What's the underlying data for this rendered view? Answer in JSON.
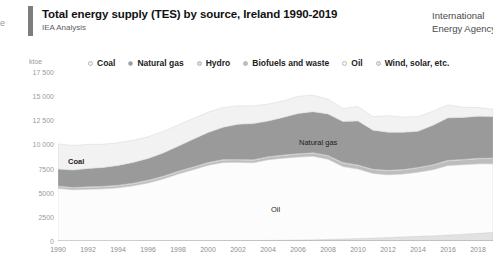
{
  "edge_fragment": "e",
  "header": {
    "title": "Total energy supply (TES) by source, Ireland 1990-2019",
    "subtitle": "IEA Analysis",
    "brand_line1": "International",
    "brand_line2": "Energy Agency"
  },
  "legend": {
    "items": [
      {
        "label": "Coal",
        "color": "#f2f2f2"
      },
      {
        "label": "Natural gas",
        "color": "#9a9a9a"
      },
      {
        "label": "Hydro",
        "color": "#d8d8d8"
      },
      {
        "label": "Biofuels and waste",
        "color": "#bdbdbd"
      },
      {
        "label": "Oil",
        "color": "#fcfcfc"
      },
      {
        "label": "Wind, solar, etc.",
        "color": "#e2e2e2"
      }
    ]
  },
  "axes": {
    "y_unit": "ktoe",
    "y_ticks": [
      "0",
      "2500",
      "5000",
      "7500",
      "10 000",
      "12 500",
      "15 000",
      "17 500"
    ],
    "x_ticks": [
      "1990",
      "1992",
      "1994",
      "1996",
      "1998",
      "2000",
      "2002",
      "2004",
      "2006",
      "2008",
      "2010",
      "2012",
      "2014",
      "2016",
      "2018"
    ]
  },
  "plot_labels": [
    {
      "text": "Coal",
      "x": 10,
      "y": 85,
      "bold": true
    },
    {
      "text": "Oil",
      "x": 213,
      "y": 133,
      "bold": false
    },
    {
      "text": "Natural gas",
      "x": 241,
      "y": 66,
      "bold": false
    }
  ],
  "chart_data": {
    "type": "area",
    "title": "Total energy supply (TES) by source, Ireland 1990-2019",
    "subtitle": "IEA Analysis",
    "xlabel": "",
    "ylabel": "ktoe",
    "ylim": [
      0,
      17500
    ],
    "xlim": [
      1990,
      2019
    ],
    "grid": false,
    "legend_position": "top",
    "stacked": true,
    "x": [
      1990,
      1991,
      1992,
      1993,
      1994,
      1995,
      1996,
      1997,
      1998,
      1999,
      2000,
      2001,
      2002,
      2003,
      2004,
      2005,
      2006,
      2007,
      2008,
      2009,
      2010,
      2011,
      2012,
      2013,
      2014,
      2015,
      2016,
      2017,
      2018,
      2019
    ],
    "series": [
      {
        "name": "Wind, solar, etc.",
        "color": "#e2e2e2",
        "values": [
          0,
          0,
          0,
          0,
          5,
          10,
          15,
          20,
          25,
          30,
          35,
          40,
          45,
          55,
          65,
          80,
          100,
          130,
          170,
          210,
          260,
          300,
          360,
          430,
          480,
          540,
          620,
          700,
          790,
          900
        ]
      },
      {
        "name": "Oil",
        "color": "#fcfcfc",
        "values": [
          5450,
          5300,
          5350,
          5400,
          5500,
          5700,
          6000,
          6400,
          6900,
          7350,
          7800,
          8100,
          8100,
          8050,
          8350,
          8500,
          8600,
          8650,
          8300,
          7500,
          7200,
          6700,
          6500,
          6500,
          6650,
          6850,
          7200,
          7200,
          7200,
          7100
        ]
      },
      {
        "name": "Biofuels and waste",
        "color": "#bdbdbd",
        "values": [
          180,
          180,
          180,
          190,
          190,
          200,
          200,
          210,
          210,
          220,
          220,
          230,
          230,
          240,
          250,
          260,
          280,
          300,
          320,
          340,
          360,
          370,
          390,
          410,
          430,
          450,
          470,
          490,
          510,
          530
        ]
      },
      {
        "name": "Hydro",
        "color": "#d8d8d8",
        "values": [
          70,
          70,
          75,
          75,
          80,
          80,
          75,
          70,
          75,
          75,
          70,
          60,
          65,
          60,
          55,
          60,
          60,
          60,
          70,
          75,
          60,
          60,
          70,
          60,
          55,
          55,
          60,
          60,
          65,
          70
        ]
      },
      {
        "name": "Natural gas",
        "color": "#9a9a9a",
        "values": [
          1750,
          1800,
          1900,
          1950,
          2050,
          2150,
          2250,
          2400,
          2600,
          2850,
          3100,
          3350,
          3650,
          3750,
          3700,
          3900,
          4150,
          4250,
          4300,
          4250,
          4550,
          4050,
          3950,
          3850,
          3750,
          4100,
          4400,
          4350,
          4350,
          4300
        ]
      },
      {
        "name": "Coal",
        "color": "#f2f2f2",
        "values": [
          2600,
          2550,
          2500,
          2400,
          2350,
          2300,
          2250,
          2250,
          2200,
          2150,
          2100,
          2050,
          1900,
          1850,
          1750,
          1700,
          1800,
          1700,
          1550,
          1350,
          1500,
          1400,
          1700,
          1600,
          1500,
          1450,
          1350,
          1050,
          900,
          750
        ]
      }
    ],
    "totals": [
      10050,
      9900,
      10005,
      10015,
      10175,
      10440,
      10790,
      11350,
      12010,
      12675,
      13325,
      13830,
      14000,
      14005,
      14170,
      14500,
      14990,
      15090,
      14710,
      13725,
      13930,
      12880,
      12970,
      12850,
      12865,
      13445,
      14100,
      13850,
      13815,
      13650
    ]
  }
}
